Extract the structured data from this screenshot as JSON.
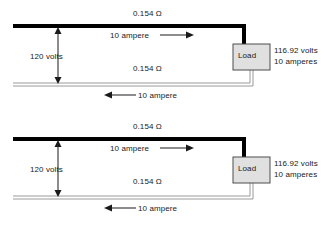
{
  "diagram": {
    "colors": {
      "supply_conductor": "#000000",
      "return_conductor": "#b3b3b3",
      "load_fill": "#e0e0e0",
      "load_border": "#4d4d4d",
      "text": "#1a1a1a"
    },
    "circuits": [
      {
        "top_resistance": "0.154 Ω",
        "top_current": "10 ampere",
        "source_voltage": "120 volts",
        "bottom_resistance": "0.154 Ω",
        "bottom_current": "10 ampere",
        "load_label": "Load",
        "load_voltage": "116.92 volts",
        "load_current": "10 amperes"
      },
      {
        "top_resistance": "0.154 Ω",
        "top_current": "10 ampere",
        "source_voltage": "120 volts",
        "bottom_resistance": "0.154 Ω",
        "bottom_current": "10 ampere",
        "load_label": "Load",
        "load_voltage": "116.92 volts",
        "load_current": "10 amperes"
      }
    ]
  }
}
